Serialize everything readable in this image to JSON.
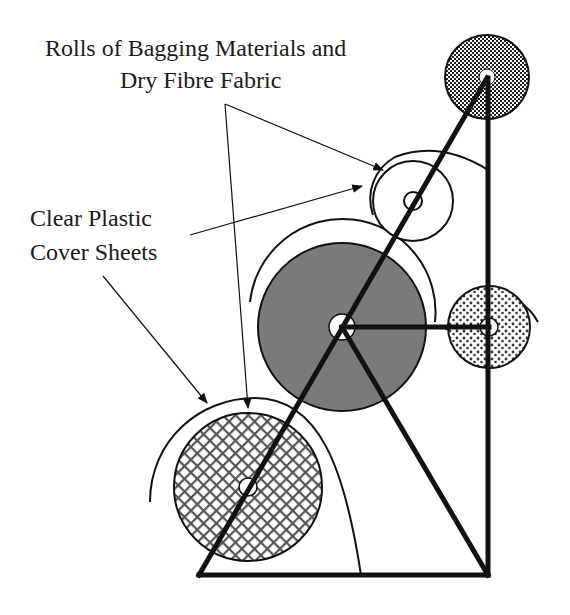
{
  "labels": {
    "rolls_line1": "Rolls of Bagging  Materials and",
    "rolls_line2": "Dry Fibre Fabric",
    "cover_line1": "Clear Plastic",
    "cover_line2": "Cover Sheets"
  },
  "rolls": [
    {
      "id": "top-roll",
      "fill": "checker-dark"
    },
    {
      "id": "white-roll",
      "fill": "white"
    },
    {
      "id": "large-grey-roll",
      "fill": "grey"
    },
    {
      "id": "dotted-roll",
      "fill": "dotted"
    },
    {
      "id": "crosshatch-roll",
      "fill": "crosshatch"
    }
  ],
  "colors": {
    "stroke": "#111111",
    "grey_fill": "#7a7a7a",
    "background": "#ffffff"
  }
}
